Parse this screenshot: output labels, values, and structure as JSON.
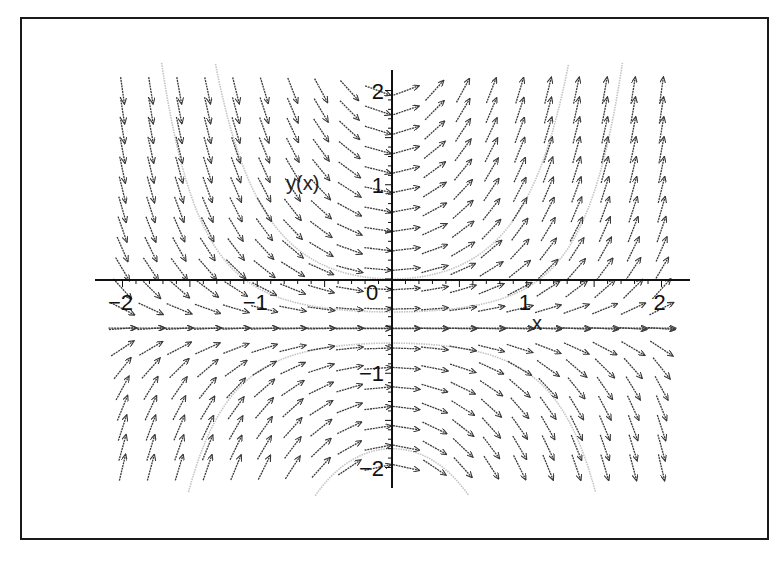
{
  "chart_data": {
    "type": "fieldplot",
    "title": "",
    "xlabel": "x",
    "ylabel": "y(x)",
    "xlim": [
      -2,
      2
    ],
    "ylim": [
      -2,
      2
    ],
    "grid": false,
    "legend": null,
    "x_ticks": [
      {
        "value": -2,
        "label": "-2"
      },
      {
        "value": -1,
        "label": "-1"
      },
      {
        "value": 0,
        "label": "0"
      },
      {
        "value": 1,
        "label": "1"
      },
      {
        "value": 2,
        "label": "2"
      }
    ],
    "y_ticks": [
      {
        "value": 2,
        "label": "2"
      },
      {
        "value": 1,
        "label": "1"
      },
      {
        "value": -1,
        "label": "-1"
      },
      {
        "value": -2,
        "label": "-2"
      }
    ],
    "direction_field": {
      "equation": "y' = x*(2*y + 1)",
      "grid_columns": 20,
      "grid_rows": 20,
      "arrow_color": "#3a3a3a",
      "equilibrium_y": -0.5
    },
    "solution_curves": {
      "formula": "y = C*exp(x^2) - 1/2",
      "color": "#c4c4c4",
      "constants": [
        0.15,
        0.5,
        -0.18,
        -1.3
      ]
    }
  },
  "colors": {
    "frame": "#1a1a1a",
    "axes": "#111111",
    "background": "#ffffff"
  }
}
